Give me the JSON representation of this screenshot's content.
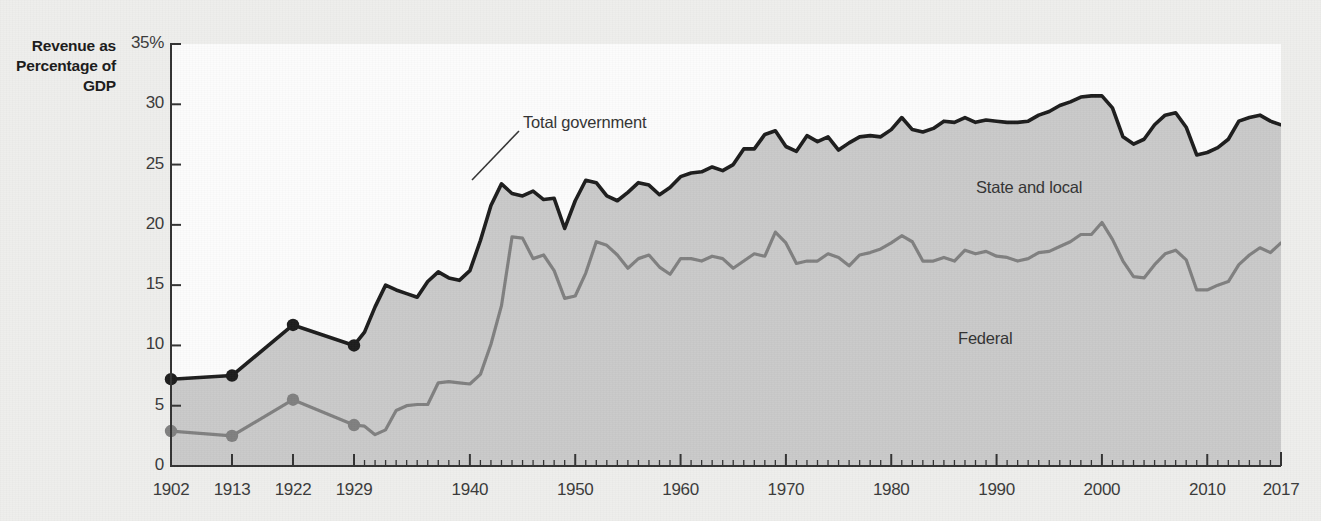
{
  "chart_data": {
    "type": "area",
    "title": "",
    "ylabel": "Revenue as Percentage of GDP",
    "xlabel": "",
    "ylim": [
      0,
      35
    ],
    "xlim": [
      1902,
      2017
    ],
    "grid": false,
    "legend_position": "inline-annotations",
    "y_tick_labels": [
      "35%",
      "30",
      "25",
      "20",
      "15",
      "10",
      "5",
      "0"
    ],
    "y_ticks": [
      35,
      30,
      25,
      20,
      15,
      10,
      5,
      0
    ],
    "x_tick_labels": [
      "1902",
      "1913",
      "1922",
      "1929",
      "1940",
      "1950",
      "1960",
      "1970",
      "1980",
      "1990",
      "2000",
      "2010",
      "2017"
    ],
    "x_ticks": [
      1902,
      1913,
      1922,
      1929,
      1940,
      1950,
      1960,
      1970,
      1980,
      1990,
      2000,
      2010,
      2017
    ],
    "annotations": [
      {
        "text": "Total government",
        "x": 1949,
        "y": 30.7
      },
      {
        "text": "State and local",
        "x": 1988,
        "y": 23.0
      },
      {
        "text": "Federal",
        "x": 1985,
        "y": 10.5
      }
    ],
    "colors": {
      "total_line": "#1c1c1c",
      "federal_line": "#808080",
      "fill": "#c9c9c9",
      "plot_background": "#fcfcfc",
      "page_background": "#eeeeec",
      "axis": "#333333",
      "text": "#333333"
    },
    "markers": {
      "note": "filled circles on sparse early observations",
      "years": [
        1902,
        1913,
        1922,
        1929
      ]
    },
    "series": [
      {
        "name": "Total government",
        "x": [
          1902,
          1913,
          1922,
          1929,
          1930,
          1931,
          1932,
          1933,
          1934,
          1935,
          1936,
          1937,
          1938,
          1939,
          1940,
          1941,
          1942,
          1943,
          1944,
          1945,
          1946,
          1947,
          1948,
          1949,
          1950,
          1951,
          1952,
          1953,
          1954,
          1955,
          1956,
          1957,
          1958,
          1959,
          1960,
          1961,
          1962,
          1963,
          1964,
          1965,
          1966,
          1967,
          1968,
          1969,
          1970,
          1971,
          1972,
          1973,
          1974,
          1975,
          1976,
          1977,
          1978,
          1979,
          1980,
          1981,
          1982,
          1983,
          1984,
          1985,
          1986,
          1987,
          1988,
          1989,
          1990,
          1991,
          1992,
          1993,
          1994,
          1995,
          1996,
          1997,
          1998,
          1999,
          2000,
          2001,
          2002,
          2003,
          2004,
          2005,
          2006,
          2007,
          2008,
          2009,
          2010,
          2011,
          2012,
          2013,
          2014,
          2015,
          2016,
          2017
        ],
        "values": [
          7.2,
          7.5,
          11.7,
          10.0,
          11.1,
          13.2,
          15.0,
          14.6,
          14.3,
          14.0,
          15.3,
          16.1,
          15.6,
          15.4,
          16.2,
          18.7,
          21.6,
          23.4,
          22.6,
          22.4,
          22.8,
          22.1,
          22.2,
          19.7,
          22.0,
          23.7,
          23.5,
          22.4,
          22.0,
          22.7,
          23.5,
          23.3,
          22.5,
          23.1,
          24.0,
          24.3,
          24.4,
          24.8,
          24.5,
          25.0,
          26.3,
          26.3,
          27.5,
          27.8,
          26.5,
          26.1,
          27.4,
          26.9,
          27.3,
          26.2,
          26.8,
          27.3,
          27.4,
          27.3,
          27.9,
          28.9,
          27.9,
          27.7,
          28.0,
          28.6,
          28.5,
          28.9,
          28.5,
          28.7,
          28.6,
          28.5,
          28.5,
          28.6,
          29.1,
          29.4,
          29.9,
          30.2,
          30.6,
          30.7,
          30.7,
          29.7,
          27.3,
          26.7,
          27.1,
          28.3,
          29.1,
          29.3,
          28.1,
          25.8,
          26.0,
          26.4,
          27.1,
          28.6,
          28.9,
          29.1,
          28.6,
          28.3
        ]
      },
      {
        "name": "Federal",
        "x": [
          1902,
          1913,
          1922,
          1929,
          1930,
          1931,
          1932,
          1933,
          1934,
          1935,
          1936,
          1937,
          1938,
          1939,
          1940,
          1941,
          1942,
          1943,
          1944,
          1945,
          1946,
          1947,
          1948,
          1949,
          1950,
          1951,
          1952,
          1953,
          1954,
          1955,
          1956,
          1957,
          1958,
          1959,
          1960,
          1961,
          1962,
          1963,
          1964,
          1965,
          1966,
          1967,
          1968,
          1969,
          1970,
          1971,
          1972,
          1973,
          1974,
          1975,
          1976,
          1977,
          1978,
          1979,
          1980,
          1981,
          1982,
          1983,
          1984,
          1985,
          1986,
          1987,
          1988,
          1989,
          1990,
          1991,
          1992,
          1993,
          1994,
          1995,
          1996,
          1997,
          1998,
          1999,
          2000,
          2001,
          2002,
          2003,
          2004,
          2005,
          2006,
          2007,
          2008,
          2009,
          2010,
          2011,
          2012,
          2013,
          2014,
          2015,
          2016,
          2017
        ],
        "values": [
          2.9,
          2.5,
          5.5,
          3.4,
          3.3,
          2.6,
          3.0,
          4.6,
          5.0,
          5.1,
          5.1,
          6.9,
          7.0,
          6.9,
          6.8,
          7.6,
          10.1,
          13.3,
          19.0,
          18.9,
          17.2,
          17.5,
          16.2,
          13.9,
          14.1,
          16.0,
          18.6,
          18.3,
          17.5,
          16.4,
          17.2,
          17.5,
          16.5,
          15.9,
          17.2,
          17.2,
          17.0,
          17.4,
          17.2,
          16.4,
          17.0,
          17.6,
          17.4,
          19.4,
          18.5,
          16.8,
          17.0,
          17.0,
          17.6,
          17.3,
          16.6,
          17.5,
          17.7,
          18.0,
          18.5,
          19.1,
          18.6,
          17.0,
          17.0,
          17.3,
          17.0,
          17.9,
          17.6,
          17.8,
          17.4,
          17.3,
          17.0,
          17.2,
          17.7,
          17.8,
          18.2,
          18.6,
          19.2,
          19.2,
          20.2,
          18.8,
          17.0,
          15.7,
          15.6,
          16.7,
          17.6,
          17.9,
          17.1,
          14.6,
          14.6,
          15.0,
          15.3,
          16.7,
          17.5,
          18.1,
          17.7,
          18.5
        ]
      }
    ]
  }
}
